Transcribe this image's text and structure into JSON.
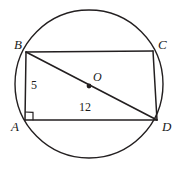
{
  "figure": {
    "type": "geometry-diagram",
    "background_color": "#ffffff",
    "stroke_color": "#231f20",
    "circle": {
      "name": "circumscribed-circle",
      "center_x": 89,
      "center_y": 84,
      "radius": 74,
      "stroke_width": 1.4
    },
    "center_point": {
      "label": "O",
      "x": 89,
      "y": 86,
      "dot_radius": 2.4
    },
    "vertices": [
      {
        "label": "B",
        "x": 26,
        "y": 52,
        "label_x": 14,
        "label_y": 38
      },
      {
        "label": "C",
        "x": 153,
        "y": 51,
        "label_x": 158,
        "label_y": 38
      },
      {
        "label": "A",
        "x": 25,
        "y": 120,
        "label_x": 11,
        "label_y": 120
      },
      {
        "label": "D",
        "x": 157,
        "y": 120,
        "label_x": 162,
        "label_y": 120
      }
    ],
    "segments": [
      {
        "name": "segment-bc",
        "from": "B",
        "to": "C"
      },
      {
        "name": "segment-ad",
        "from": "A",
        "to": "D"
      },
      {
        "name": "segment-ab",
        "from": "A",
        "to": "B"
      },
      {
        "name": "segment-cd",
        "from": "C",
        "to": "D"
      },
      {
        "name": "diagonal-bd",
        "from": "B",
        "to": "D"
      }
    ],
    "measures": [
      {
        "name": "side-ab-length",
        "value": "5",
        "x": 31,
        "y": 79,
        "of": "AB"
      },
      {
        "name": "side-ad-length",
        "value": "12",
        "x": 79,
        "y": 101,
        "of": "AD"
      }
    ],
    "right_angle": {
      "name": "right-angle-marker-a",
      "at_vertex": "A",
      "size": 8
    }
  }
}
